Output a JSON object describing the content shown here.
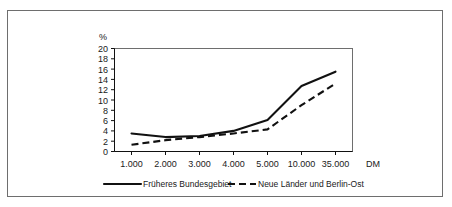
{
  "chart_data": {
    "type": "line",
    "title": "",
    "xlabel": "DM",
    "ylabel": "%",
    "categories": [
      "1.000",
      "2.000",
      "3.000",
      "4.000",
      "5.000",
      "10.000",
      "35.000"
    ],
    "ylim": [
      0,
      20
    ],
    "ytick_step": 2,
    "yticks": [
      "20",
      "18",
      "16",
      "14",
      "12",
      "10",
      "8",
      "6",
      "4",
      "2",
      "0"
    ],
    "grid": false,
    "legend_position": "bottom-center",
    "series": [
      {
        "name": "Früheres Bundesgebiet",
        "style": "solid",
        "color": "#111111",
        "values": [
          3.5,
          2.8,
          3.0,
          4.0,
          6.1,
          12.7,
          15.5
        ]
      },
      {
        "name": "Neue Länder und Berlin-Ost",
        "style": "dashed",
        "color": "#111111",
        "values": [
          1.3,
          2.2,
          2.8,
          3.5,
          4.3,
          9.0,
          13.2
        ]
      }
    ]
  },
  "axes": {
    "y_unit_label": "%",
    "x_unit_label": "DM"
  },
  "legend": {
    "items": [
      {
        "label": "Früheres Bundesgebiet",
        "style": "solid"
      },
      {
        "label": "Neue Länder und Berlin-Ost",
        "style": "dashed"
      }
    ]
  },
  "colors": {
    "series_line": "#111111",
    "frame": "#6e6e6e",
    "axis": "#111111",
    "background": "#ffffff"
  }
}
